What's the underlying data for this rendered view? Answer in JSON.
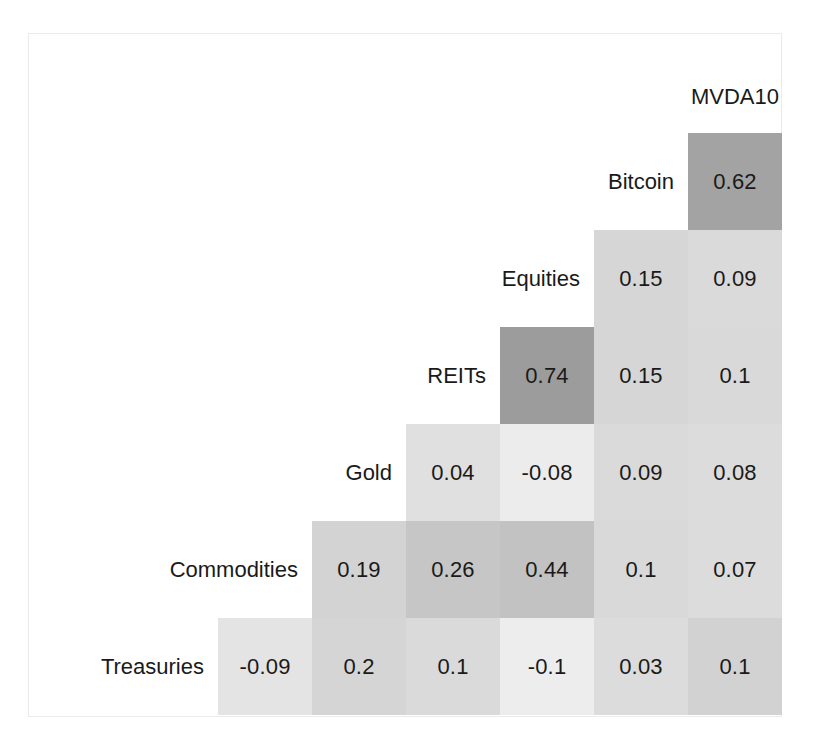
{
  "chart_data": {
    "type": "heatmap",
    "title": "",
    "subtitle": "",
    "xlabel": "",
    "ylabel": "",
    "legend": "none",
    "grid": false,
    "matrix_form": "lower-triangular",
    "value_range": [
      -0.1,
      0.74
    ],
    "color_scale": {
      "low": "#f2f2f2",
      "mid": "#d4d4d4",
      "high": "#9e9e9e",
      "description": "grayscale, darker = higher correlation"
    },
    "columns": [
      "Commodities",
      "Gold",
      "REITs",
      "Equities",
      "Bitcoin",
      "MVDA10"
    ],
    "top_header": "MVDA10",
    "rows": [
      {
        "label": "Bitcoin",
        "label_col_index": 4,
        "cells": [
          {
            "col": "MVDA10",
            "col_index": 5,
            "value": "0.62",
            "n": 0.62,
            "shade": "#a3a3a3"
          }
        ]
      },
      {
        "label": "Equities",
        "label_col_index": 3,
        "cells": [
          {
            "col": "Bitcoin",
            "col_index": 4,
            "value": "0.15",
            "n": 0.15,
            "shade": "#d6d6d6"
          },
          {
            "col": "MVDA10",
            "col_index": 5,
            "value": "0.09",
            "n": 0.09,
            "shade": "#dadada"
          }
        ]
      },
      {
        "label": "REITs",
        "label_col_index": 2,
        "cells": [
          {
            "col": "Equities",
            "col_index": 3,
            "value": "0.74",
            "n": 0.74,
            "shade": "#9c9c9c"
          },
          {
            "col": "Bitcoin",
            "col_index": 4,
            "value": "0.15",
            "n": 0.15,
            "shade": "#d6d6d6"
          },
          {
            "col": "MVDA10",
            "col_index": 5,
            "value": "0.1",
            "n": 0.1,
            "shade": "#d9d9d9"
          }
        ]
      },
      {
        "label": "Gold",
        "label_col_index": 1,
        "cells": [
          {
            "col": "REITs",
            "col_index": 2,
            "value": "0.04",
            "n": 0.04,
            "shade": "#e0e0e0"
          },
          {
            "col": "Equities",
            "col_index": 3,
            "value": "-0.08",
            "n": -0.08,
            "shade": "#ececec"
          },
          {
            "col": "Bitcoin",
            "col_index": 4,
            "value": "0.09",
            "n": 0.09,
            "shade": "#dadada"
          },
          {
            "col": "MVDA10",
            "col_index": 5,
            "value": "0.08",
            "n": 0.08,
            "shade": "#dcdcdc"
          }
        ]
      },
      {
        "label": "Commodities",
        "label_col_index": 0,
        "cells": [
          {
            "col": "Gold",
            "col_index": 1,
            "value": "0.19",
            "n": 0.19,
            "shade": "#d3d3d3"
          },
          {
            "col": "REITs",
            "col_index": 2,
            "value": "0.26",
            "n": 0.26,
            "shade": "#c6c6c6"
          },
          {
            "col": "Equities",
            "col_index": 3,
            "value": "0.44",
            "n": 0.44,
            "shade": "#c2c2c2"
          },
          {
            "col": "Bitcoin",
            "col_index": 4,
            "value": "0.1",
            "n": 0.1,
            "shade": "#d9d9d9"
          },
          {
            "col": "MVDA10",
            "col_index": 5,
            "value": "0.07",
            "n": 0.07,
            "shade": "#dcdcdc"
          }
        ]
      },
      {
        "label": "Treasuries",
        "label_col_index": -1,
        "cells": [
          {
            "col": "Commodities",
            "col_index": 0,
            "value": "-0.09",
            "n": -0.09,
            "shade": "#e4e4e4"
          },
          {
            "col": "Gold",
            "col_index": 1,
            "value": "0.2",
            "n": 0.2,
            "shade": "#d5d5d5"
          },
          {
            "col": "REITs",
            "col_index": 2,
            "value": "0.1",
            "n": 0.1,
            "shade": "#dadada"
          },
          {
            "col": "Equities",
            "col_index": 3,
            "value": "-0.1",
            "n": -0.1,
            "shade": "#ededed"
          },
          {
            "col": "Bitcoin",
            "col_index": 4,
            "value": "0.03",
            "n": 0.03,
            "shade": "#dcdcdc"
          },
          {
            "col": "MVDA10",
            "col_index": 5,
            "value": "0.1",
            "n": 0.1,
            "shade": "#d2d2d2"
          }
        ]
      }
    ]
  },
  "layout": {
    "grid_left": 218,
    "grid_top": 133,
    "cell_w": 94,
    "cell_h": 97,
    "header_y": 82,
    "label_width": 190
  }
}
